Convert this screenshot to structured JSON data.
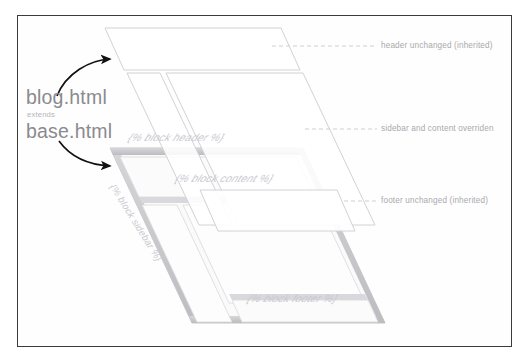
{
  "diagram": {
    "templates": {
      "child_name": "blog.html",
      "relation": "extends",
      "parent_name": "base.html"
    },
    "blocks": [
      {
        "id": "header",
        "label": "{% block header %}"
      },
      {
        "id": "sidebar",
        "label": "{% block sidebar %}"
      },
      {
        "id": "content",
        "label": "{% block content %}"
      },
      {
        "id": "footer",
        "label": "{% block footer %}"
      }
    ],
    "callouts": [
      {
        "id": "header-callout",
        "label": "header unchanged (inherited)"
      },
      {
        "id": "sidebar-callout",
        "label": "sidebar and content overriden"
      },
      {
        "id": "footer-callout",
        "label": "footer unchanged (inherited)"
      }
    ],
    "colors": {
      "frame_border": "#3b3b3b",
      "base_fill": "#f4f4f5",
      "base_edge": "#c3c3c6",
      "overlay_stroke": "#d4d4d8",
      "label_text": "#a9a9ad",
      "template_text": "#8a8a8f",
      "block_text": "#c9c9cf",
      "arrow": "#111111",
      "dash": "#cfcfd4"
    }
  }
}
